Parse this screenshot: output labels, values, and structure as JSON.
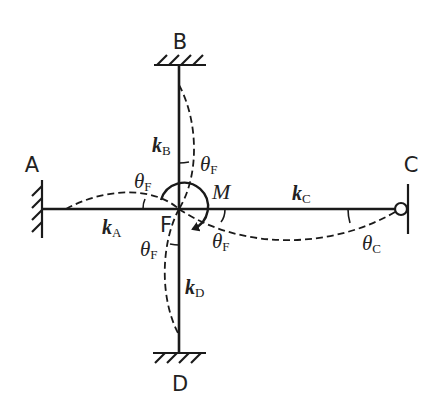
{
  "diagram": {
    "nodes": {
      "A": {
        "label": "A",
        "support": "fixed"
      },
      "B": {
        "label": "B",
        "support": "fixed"
      },
      "C": {
        "label": "C",
        "support": "pin"
      },
      "D": {
        "label": "D",
        "support": "fixed"
      },
      "F": {
        "label": "F",
        "type": "joint"
      }
    },
    "members": {
      "A": {
        "stiffness_symbol": "k",
        "stiffness_sub": "A"
      },
      "B": {
        "stiffness_symbol": "k",
        "stiffness_sub": "B"
      },
      "C": {
        "stiffness_symbol": "k",
        "stiffness_sub": "C"
      },
      "D": {
        "stiffness_symbol": "k",
        "stiffness_sub": "D"
      }
    },
    "load": {
      "symbol": "M",
      "direction": "clockwise"
    },
    "angles": {
      "thetaF": {
        "symbol": "θ",
        "sub": "F"
      },
      "thetaC": {
        "symbol": "θ",
        "sub": "C"
      }
    },
    "colors": {
      "stroke": "#1a1a1a",
      "text": "#222222",
      "background": "#ffffff"
    }
  }
}
